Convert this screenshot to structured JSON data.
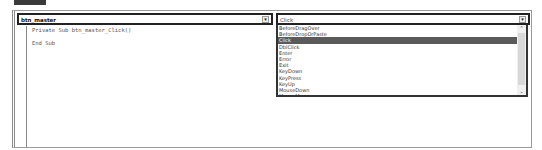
{
  "object_combo": {
    "value": "btn_master",
    "arrow": "▾"
  },
  "procedure_combo": {
    "value": "Click",
    "arrow": "▾"
  },
  "code_lines": [
    "Private Sub btn_master_Click()",
    "End Sub"
  ],
  "procedure_list": {
    "items": [
      "BeforeDragOver",
      "BeforeDropOrPaste",
      "Click",
      "DblClick",
      "Enter",
      "Error",
      "Exit",
      "KeyDown",
      "KeyPress",
      "KeyUp",
      "MouseDown",
      "MouseMove"
    ],
    "selected": "Click",
    "scroll_up": "⌃",
    "scroll_down": "⌄"
  },
  "colors": {
    "selection": "#5a5a5a",
    "border": "#222222"
  }
}
